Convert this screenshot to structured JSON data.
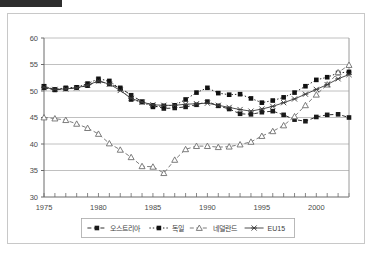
{
  "window": {
    "top_bar_color": "#2e2e2e"
  },
  "chart_data": {
    "type": "line",
    "title": "",
    "subtitle": "",
    "xlabel": "",
    "ylabel": "",
    "xlim": [
      1975,
      2003
    ],
    "ylim": [
      30,
      60
    ],
    "ytick_step": 5,
    "yticks": [
      "30",
      "35",
      "40",
      "45",
      "50",
      "55",
      "60"
    ],
    "xticks": [
      "1975",
      "1980",
      "1985",
      "1990",
      "1995",
      "2000"
    ],
    "xtick_values": [
      1975,
      1980,
      1985,
      1990,
      1995,
      2000
    ],
    "minor_xticks": true,
    "grid": "horizontal",
    "grid_color": "#b0b0b0",
    "legend_position": "bottom",
    "x": [
      1975,
      1976,
      1977,
      1978,
      1979,
      1980,
      1981,
      1982,
      1983,
      1984,
      1985,
      1986,
      1987,
      1988,
      1989,
      1990,
      1991,
      1992,
      1993,
      1994,
      1995,
      1996,
      1997,
      1998,
      1999,
      2000,
      2001,
      2002,
      2003
    ],
    "series": [
      {
        "name": "오스트리아",
        "marker": "filled-square",
        "line_style": "dashed",
        "color": "#1a1a1a",
        "values": [
          50.6,
          50.2,
          50.4,
          50.6,
          51.0,
          51.9,
          51.3,
          50.6,
          49.2,
          48.0,
          47.3,
          46.7,
          46.8,
          47.0,
          47.4,
          48.0,
          47.2,
          46.6,
          45.7,
          45.6,
          46.0,
          46.2,
          45.5,
          44.6,
          44.3,
          45.1,
          45.5,
          45.6,
          45.0
        ]
      },
      {
        "name": "독일",
        "marker": "filled-square-dotted",
        "line_style": "dotted",
        "color": "#111111",
        "values": [
          50.9,
          50.3,
          50.6,
          50.7,
          51.4,
          52.3,
          51.9,
          50.4,
          48.4,
          47.9,
          47.0,
          47.2,
          47.3,
          48.4,
          49.7,
          50.6,
          49.6,
          49.3,
          49.4,
          48.6,
          47.8,
          48.2,
          48.8,
          49.7,
          50.9,
          52.1,
          52.6,
          53.4,
          53.6
        ]
      },
      {
        "name": "네덜란드",
        "marker": "open-triangle",
        "line_style": "dashed",
        "color": "#6e6e6e",
        "values": [
          45.0,
          44.8,
          44.5,
          43.8,
          43.0,
          41.9,
          40.1,
          38.9,
          37.5,
          35.8,
          35.7,
          34.5,
          37.0,
          39.0,
          39.6,
          39.6,
          39.4,
          39.5,
          39.9,
          40.4,
          41.5,
          42.4,
          43.5,
          45.2,
          47.3,
          49.3,
          51.2,
          53.5,
          54.9
        ]
      },
      {
        "name": "EU15",
        "marker": "star-x",
        "line_style": "solid",
        "color": "#3a3a3a",
        "values": [
          50.7,
          50.3,
          50.4,
          50.6,
          51.1,
          51.9,
          51.3,
          50.1,
          48.6,
          47.9,
          47.4,
          47.3,
          47.3,
          47.5,
          47.6,
          47.7,
          47.3,
          46.9,
          46.5,
          46.2,
          46.6,
          47.1,
          47.8,
          48.5,
          49.4,
          50.3,
          51.2,
          52.3,
          53.1
        ]
      }
    ]
  }
}
